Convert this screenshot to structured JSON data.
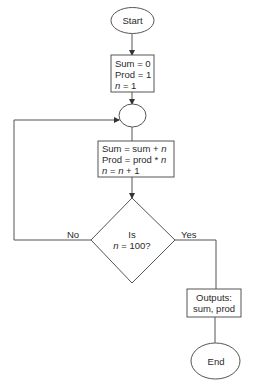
{
  "diagram": {
    "type": "flowchart",
    "nodes": {
      "start": {
        "shape": "ellipse",
        "label": "Start"
      },
      "init": {
        "shape": "process",
        "lines": [
          {
            "text": "Sum = 0"
          },
          {
            "text": "Prod = 1"
          },
          {
            "var": "n",
            "text": " = 1"
          }
        ]
      },
      "connector": {
        "shape": "circle-connector",
        "label": ""
      },
      "loop_body": {
        "shape": "process",
        "lines": [
          {
            "text": "Sum = sum + ",
            "var": "n"
          },
          {
            "text": "Prod = prod * ",
            "var": "n"
          },
          {
            "var": "n",
            "text": " = ",
            "var2": "n",
            "text2": " + 1"
          }
        ]
      },
      "decision": {
        "shape": "diamond",
        "line1": "Is",
        "line2_var": "n",
        "line2_text": " = 100?"
      },
      "output": {
        "shape": "process",
        "line1": "Outputs:",
        "line2": "sum, prod"
      },
      "end": {
        "shape": "ellipse",
        "label": "End"
      }
    },
    "edges": {
      "no_label": "No",
      "yes_label": "Yes"
    },
    "colors": {
      "stroke": "#555555",
      "text": "#2a2a2a",
      "background": "#ffffff"
    }
  }
}
